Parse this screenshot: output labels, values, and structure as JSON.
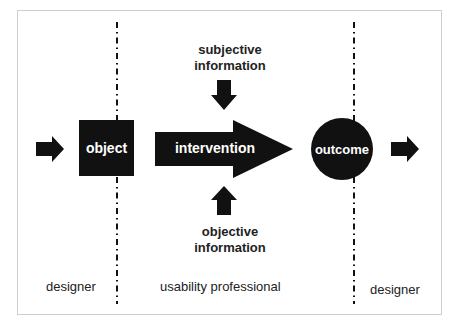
{
  "diagram": {
    "colors": {
      "shape_fill": "#111111",
      "label_on_shape": "#ffffff",
      "text": "#222222",
      "frame": "#cfcfcf"
    },
    "nodes": {
      "object": {
        "label": "object",
        "shape": "square"
      },
      "intervention": {
        "label": "intervention",
        "shape": "big-arrow-right"
      },
      "outcome": {
        "label": "outcome",
        "shape": "circle"
      }
    },
    "inputs": {
      "subjective": {
        "line1": "subjective",
        "line2": "information",
        "arrow": "arrow-down"
      },
      "objective": {
        "line1": "objective",
        "line2": "information",
        "arrow": "arrow-up"
      }
    },
    "flow_arrows": [
      "arrow-right-in",
      "arrow-right-out"
    ],
    "roles": {
      "left": "designer",
      "middle": "usability professional",
      "right": "designer"
    },
    "dividers": [
      "dash-dot-left",
      "dash-dot-right"
    ]
  }
}
